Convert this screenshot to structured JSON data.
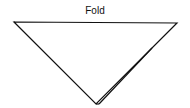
{
  "diagram": {
    "label": "Fold",
    "stroke_color": "#111111",
    "background": "#ffffff",
    "shape": "inverted-triangle",
    "triangle": {
      "top_left": [
        14,
        22
      ],
      "top_right": [
        177,
        23
      ],
      "apex": [
        96,
        104
      ]
    },
    "inner_edge": {
      "start": [
        152,
        48
      ],
      "end": [
        99,
        104
      ]
    }
  }
}
